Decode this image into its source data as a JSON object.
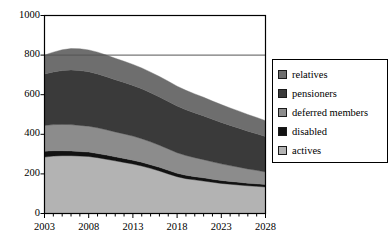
{
  "chart_data": {
    "type": "area",
    "stacked": true,
    "title": "",
    "xlabel": "",
    "ylabel": "",
    "xlim": [
      2003,
      2028
    ],
    "ylim": [
      0,
      1000
    ],
    "ytick_labels": [
      "0",
      "200",
      "400",
      "600",
      "800",
      "1000"
    ],
    "ytick_values": [
      0,
      200,
      400,
      600,
      800,
      1000
    ],
    "xtick_labels": [
      "2003",
      "2008",
      "2013",
      "2018",
      "2023",
      "2028"
    ],
    "xtick_values": [
      2003,
      2008,
      2013,
      2018,
      2023,
      2028
    ],
    "minor_xticks_every": 1,
    "grid": "horizontal-at-800",
    "legend_position": "right",
    "x": [
      2003,
      2004,
      2005,
      2006,
      2007,
      2008,
      2009,
      2010,
      2011,
      2012,
      2013,
      2014,
      2015,
      2016,
      2017,
      2018,
      2019,
      2020,
      2021,
      2022,
      2023,
      2024,
      2025,
      2026,
      2027,
      2028
    ],
    "series": [
      {
        "name": "actives",
        "color": "#b3b3b3",
        "values": [
          285,
          290,
          292,
          292,
          290,
          288,
          282,
          274,
          266,
          258,
          250,
          240,
          228,
          215,
          200,
          186,
          176,
          170,
          164,
          158,
          152,
          148,
          144,
          140,
          137,
          134
        ]
      },
      {
        "name": "disabled",
        "color": "#121212",
        "values": [
          30,
          27,
          25,
          24,
          23,
          22,
          21,
          21,
          20,
          20,
          19,
          19,
          18,
          18,
          18,
          17,
          17,
          16,
          16,
          15,
          15,
          14,
          14,
          13,
          13,
          12
        ]
      },
      {
        "name": "deferred members",
        "color": "#8c8c8c",
        "values": [
          130,
          132,
          133,
          133,
          132,
          131,
          130,
          128,
          126,
          124,
          122,
          119,
          116,
          112,
          108,
          104,
          100,
          96,
          92,
          88,
          84,
          80,
          76,
          72,
          68,
          64
        ]
      },
      {
        "name": "pensioners",
        "color": "#3a3a3a",
        "values": [
          260,
          266,
          272,
          276,
          277,
          275,
          272,
          268,
          264,
          260,
          256,
          252,
          248,
          244,
          240,
          236,
          231,
          226,
          221,
          215,
          209,
          203,
          197,
          191,
          185,
          179
        ]
      },
      {
        "name": "relatives",
        "color": "#6e6e6e",
        "values": [
          95,
          100,
          105,
          108,
          110,
          110,
          110,
          109,
          108,
          107,
          106,
          105,
          104,
          103,
          102,
          100,
          98,
          96,
          94,
          92,
          90,
          88,
          86,
          84,
          82,
          80
        ]
      }
    ],
    "legend_entries": [
      {
        "label": "relatives",
        "color": "#6e6e6e"
      },
      {
        "label": "pensioners",
        "color": "#3a3a3a"
      },
      {
        "label": "deferred members",
        "color": "#8c8c8c"
      },
      {
        "label": "disabled",
        "color": "#121212"
      },
      {
        "label": "actives",
        "color": "#b3b3b3"
      }
    ],
    "axis_color": "#000000",
    "plot_background": "#ffffff"
  }
}
